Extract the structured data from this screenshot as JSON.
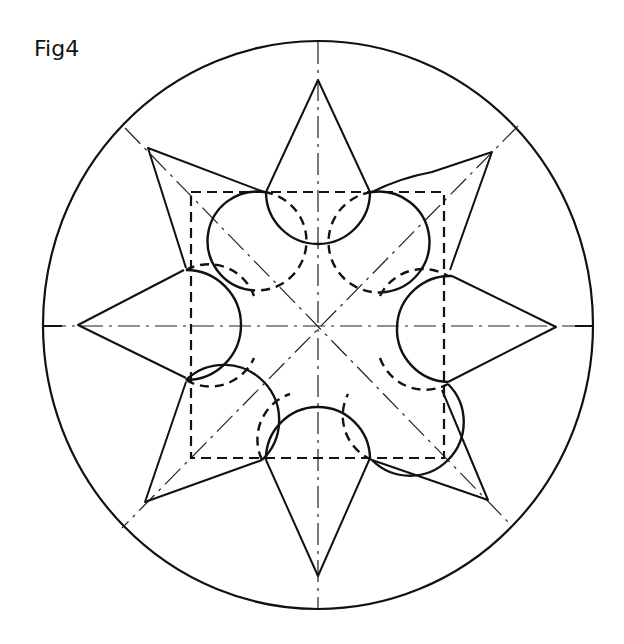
{
  "figure": {
    "label": "Fig4",
    "stroke_color": "#111111",
    "background": "#ffffff"
  },
  "geometry": {
    "center": [
      318,
      326
    ],
    "outer_circle": {
      "rx": 275,
      "ry": 284,
      "style": "solid"
    },
    "dashed_square": {
      "x1": 191,
      "y1": 192,
      "x2": 444,
      "y2": 458,
      "style": "dashed"
    },
    "center_lines": [
      "horizontal",
      "vertical",
      "diagonal-tl-br",
      "diagonal-tr-bl"
    ],
    "star_points": {
      "top": [
        318,
        80
      ],
      "top_right": [
        492,
        152
      ],
      "right": [
        556,
        327
      ],
      "bottom_right": [
        488,
        500
      ],
      "bottom": [
        318,
        576
      ],
      "bottom_left": [
        145,
        502
      ],
      "left": [
        78,
        325
      ],
      "top_left": [
        148,
        148
      ]
    },
    "lobe_circles": [
      {
        "name": "top",
        "cx": 318,
        "cy": 222,
        "r": 42
      },
      {
        "name": "top-right",
        "cx": 390,
        "cy": 232,
        "r": 42
      },
      {
        "name": "right",
        "cx": 414,
        "cy": 307,
        "r": 42
      },
      {
        "name": "bottom-right",
        "cx": 398,
        "cy": 403,
        "r": 42
      },
      {
        "name": "bottom",
        "cx": 318,
        "cy": 431,
        "r": 42
      },
      {
        "name": "bottom-left",
        "cx": 248,
        "cy": 415,
        "r": 42
      },
      {
        "name": "left",
        "cx": 218,
        "cy": 305,
        "r": 42
      },
      {
        "name": "top-left",
        "cx": 238,
        "cy": 230,
        "r": 42
      }
    ]
  }
}
